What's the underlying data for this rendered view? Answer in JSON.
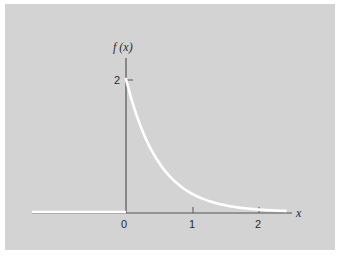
{
  "chart_data": {
    "type": "line",
    "title": "",
    "xlabel": "x",
    "ylabel": "f (x)",
    "function": "f(x) = 2e^{-2x} for x >= 0, 0 for x < 0",
    "x": [
      -1.4,
      0,
      0,
      0.1,
      0.2,
      0.3,
      0.4,
      0.5,
      0.75,
      1.0,
      1.25,
      1.5,
      1.75,
      2.0,
      2.25,
      2.4
    ],
    "series": [
      {
        "name": "f(x)",
        "values": [
          0,
          0,
          2.0,
          1.64,
          1.34,
          1.1,
          0.9,
          0.74,
          0.45,
          0.27,
          0.16,
          0.1,
          0.06,
          0.04,
          0.02,
          0.02
        ]
      }
    ],
    "x_ticks": [
      "0",
      "1",
      "2"
    ],
    "y_ticks": [
      "2"
    ],
    "xlim": [
      -1.4,
      2.7
    ],
    "ylim": [
      0,
      2.5
    ],
    "grid": false,
    "legend": null
  },
  "labels": {
    "y_axis": "f (x)",
    "x_axis": "x",
    "tick_x0": "0",
    "tick_x1": "1",
    "tick_x2": "2",
    "tick_y2": "2"
  },
  "colors": {
    "background": "#d3d3d3",
    "axis": "#555555",
    "curve": "#ffffff"
  }
}
